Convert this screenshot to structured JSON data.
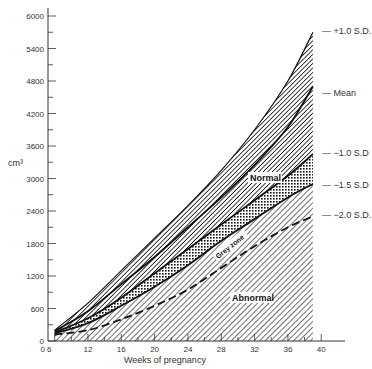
{
  "chart_data": {
    "type": "area",
    "title": "",
    "xlabel": "Weeks of pregnancy",
    "ylabel": "cm³",
    "xlim": [
      6,
      42
    ],
    "ylim": [
      0,
      6000
    ],
    "x_ticks": [
      12,
      16,
      20,
      24,
      28,
      32,
      36,
      40
    ],
    "x_tick_labels": [
      "0 6",
      "12",
      "16",
      "20",
      "24",
      "28",
      "32",
      "36",
      "40"
    ],
    "y_ticks": [
      0,
      600,
      1200,
      1800,
      2400,
      3000,
      3600,
      4200,
      4800,
      5400,
      6000
    ],
    "y_tick_labels": [
      "0",
      "600",
      "1200",
      "1800",
      "2400",
      "3000",
      "3600",
      "4200",
      "4800",
      "5400",
      "6000"
    ],
    "grid": false,
    "x": [
      8,
      12,
      16,
      20,
      24,
      28,
      32,
      36,
      39
    ],
    "series": [
      {
        "name": "+1.0 S.D.",
        "style": "solid",
        "values": [
          200,
          700,
          1300,
          1900,
          2500,
          3150,
          3900,
          4800,
          5700
        ]
      },
      {
        "name": "Mean",
        "style": "solid",
        "values": [
          180,
          550,
          1050,
          1550,
          2100,
          2650,
          3250,
          3950,
          4700
        ]
      },
      {
        "name": "−1.0 S.D",
        "style": "solid",
        "values": [
          160,
          420,
          800,
          1250,
          1700,
          2150,
          2600,
          3050,
          3450
        ]
      },
      {
        "name": "−1.5 S.D",
        "style": "solid",
        "values": [
          140,
          330,
          650,
          1000,
          1400,
          1850,
          2250,
          2650,
          2900
        ]
      },
      {
        "name": "−2.0 S.D.",
        "style": "dashed",
        "values": [
          120,
          200,
          400,
          650,
          950,
          1350,
          1750,
          2100,
          2300
        ]
      }
    ],
    "zones": [
      {
        "name": "Normal",
        "from": "−1.0 S.D",
        "to": "+1.0 S.D.",
        "fill": "hatch-dense"
      },
      {
        "name": "Grey zone",
        "from": "−1.5 S.D",
        "to": "−1.0 S.D",
        "fill": "crosshatch"
      },
      {
        "name": "Abnormal",
        "from": "0",
        "to": "−1.5 S.D",
        "fill": "hatch"
      }
    ],
    "legend_position": "right (inline labels)"
  },
  "labels": {
    "y_unit": "cm³",
    "x_title": "Weeks of pregnancy",
    "sd_plus1": "— +1.0 S.D.",
    "mean": "— Mean",
    "sd_minus1": "— −1.0 S.D",
    "sd_minus15": "— −1.5 S.D",
    "sd_minus2": "— −2.0 S.D.",
    "zone_normal": "Normal",
    "zone_grey": "Grey zone",
    "zone_abnormal": "Abnormal"
  }
}
